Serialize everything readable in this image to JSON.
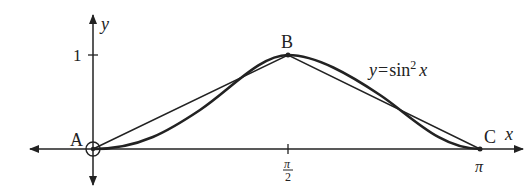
{
  "axes": {
    "x_label": "x",
    "y_label": "y",
    "y_tick_label": "1",
    "x_tick_half_pi_num": "π",
    "x_tick_half_pi_den": "2",
    "x_tick_pi": "π"
  },
  "points": {
    "A": "A",
    "B": "B",
    "C": "C"
  },
  "curve_label": {
    "lhs": "y",
    "eq": "=",
    "fn": "sin",
    "exp": "2",
    "arg": "x"
  },
  "colors": {
    "ink": "#222222",
    "background": "#ffffff"
  }
}
